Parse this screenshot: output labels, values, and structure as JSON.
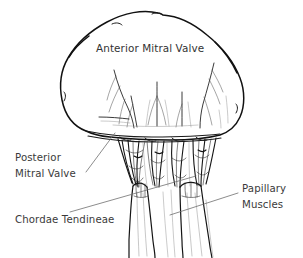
{
  "figure": {
    "name": "mitral-valve-anatomy-diagram",
    "background_color": "#ffffff",
    "ink_color": "#111111",
    "text_color": "#3a3a3a",
    "leader_color": "#6e6e6e",
    "width": 303,
    "height": 258
  },
  "labels": {
    "anterior_mitral_valve": "Anterior Mitral Valve",
    "posterior_line1": "Posterior",
    "posterior_line2": "Mitral Valve",
    "chordae_tendineae": "Chordae Tendineae",
    "papillary_line1": "Papillary",
    "papillary_line2": "Muscles"
  },
  "structures": [
    {
      "name": "anterior-mitral-valve-leaflet",
      "label": "Anterior Mitral Valve"
    },
    {
      "name": "posterior-mitral-valve",
      "label": "Posterior Mitral Valve"
    },
    {
      "name": "chordae-tendineae",
      "label": "Chordae Tendineae"
    },
    {
      "name": "papillary-muscles",
      "label": "Papillary Muscles"
    }
  ]
}
